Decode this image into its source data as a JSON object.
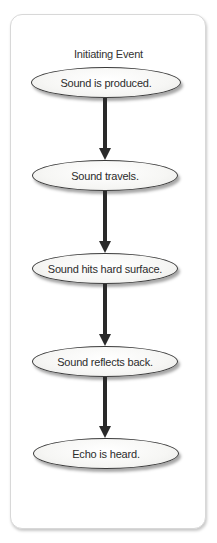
{
  "diagram": {
    "type": "flowchart",
    "title": "Initiating Event",
    "nodes": [
      {
        "label": "Sound is produced."
      },
      {
        "label": "Sound travels."
      },
      {
        "label": "Sound hits hard surface."
      },
      {
        "label": "Sound reflects back."
      },
      {
        "label": "Echo is heard."
      }
    ],
    "edges": [
      {
        "from": 0,
        "to": 1
      },
      {
        "from": 1,
        "to": 2
      },
      {
        "from": 2,
        "to": 3
      },
      {
        "from": 3,
        "to": 4
      }
    ],
    "colors": {
      "arrow": "#2a2a2a",
      "node_border": "#3a3a3a",
      "card_border": "#d8d8d8"
    }
  }
}
